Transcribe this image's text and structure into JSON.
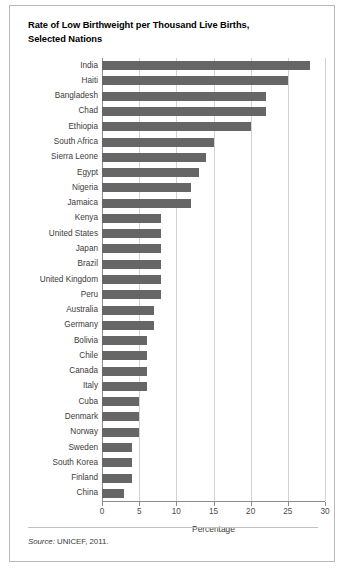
{
  "figure": {
    "title_line1": "Rate of Low Birthweight per Thousand Live Births,",
    "title_line2": "Selected Nations",
    "source_label": "Source:",
    "source_text": "UNICEF, 2011.",
    "bar_color": "#666666",
    "gridline_color": "#d2d2d2",
    "axis_color": "#8c8c8c",
    "border_color": "#b8b8b8"
  },
  "chart_data": {
    "type": "bar",
    "orientation": "horizontal",
    "title": "Rate of Low Birthweight per Thousand Live Births, Selected Nations",
    "xlabel": "Percentage",
    "ylabel": "",
    "xlim": [
      0,
      30
    ],
    "xticks": [
      0,
      5,
      10,
      15,
      20,
      25,
      30
    ],
    "xtick_labels": [
      "0",
      "5",
      "10",
      "15",
      "20",
      "25",
      "30"
    ],
    "grid": true,
    "legend": false,
    "categories": [
      "India",
      "Haiti",
      "Bangladesh",
      "Chad",
      "Ethiopia",
      "South Africa",
      "Sierra Leone",
      "Egypt",
      "Nigeria",
      "Jamaica",
      "Kenya",
      "United States",
      "Japan",
      "Brazil",
      "United Kingdom",
      "Peru",
      "Australia",
      "Germany",
      "Bolivia",
      "Chile",
      "Canada",
      "Italy",
      "Cuba",
      "Denmark",
      "Norway",
      "Sweden",
      "South Korea",
      "Finland",
      "China"
    ],
    "values": [
      28,
      25,
      22,
      22,
      20,
      15,
      14,
      13,
      12,
      12,
      8,
      8,
      8,
      8,
      8,
      8,
      7,
      7,
      6,
      6,
      6,
      6,
      5,
      5,
      5,
      4,
      4,
      4,
      3
    ],
    "annotations": []
  }
}
